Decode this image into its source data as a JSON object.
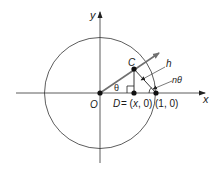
{
  "diagram": {
    "type": "unit-circle-geometry",
    "labels": {
      "y_axis": "y",
      "x_axis": "x",
      "origin": "O",
      "point_c": "C",
      "point_d": "D = (x, 0)",
      "point_d_letter": "D",
      "point_d_coords": "= (x, 0)",
      "point_unit": "(1, 0)",
      "angle_theta": "θ",
      "leader_h": "h",
      "leader_n_theta": "nθ"
    },
    "colors": {
      "line": "#222222",
      "ray": "#707070",
      "point": "#111111",
      "text": "#1a1a1a"
    }
  }
}
